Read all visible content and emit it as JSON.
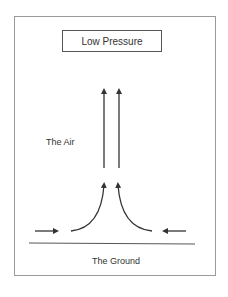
{
  "diagram": {
    "title": "Low Pressure",
    "labels": {
      "air": "The Air",
      "ground": "The Ground"
    },
    "colors": {
      "stroke": "#333333",
      "frame": "#9a9a9a"
    },
    "elements": [
      {
        "type": "arrow",
        "direction": "up",
        "description": "rising air column left"
      },
      {
        "type": "arrow",
        "direction": "up",
        "description": "rising air column right"
      },
      {
        "type": "curved-arrow",
        "description": "air converging from left and turning upward"
      },
      {
        "type": "curved-arrow",
        "description": "air converging from right and turning upward"
      },
      {
        "type": "arrow",
        "direction": "right",
        "description": "surface wind from left"
      },
      {
        "type": "arrow",
        "direction": "left",
        "description": "surface wind from right"
      },
      {
        "type": "line",
        "description": "ground line"
      }
    ]
  }
}
